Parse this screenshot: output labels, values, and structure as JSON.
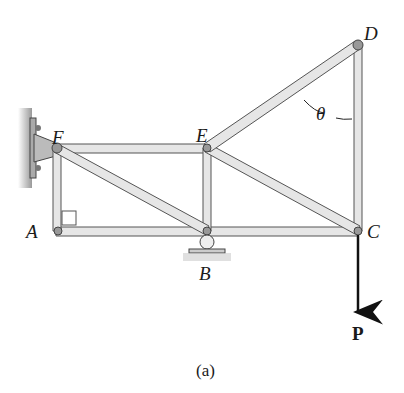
{
  "figure": {
    "caption": "(a)",
    "labels": {
      "A": "A",
      "B": "B",
      "C": "C",
      "D": "D",
      "E": "E",
      "F": "F",
      "theta": "θ",
      "P": "P"
    },
    "colors": {
      "member_fill": "#e6e6e6",
      "member_stroke": "#555555",
      "pin": "#888888",
      "load": "#111111"
    }
  }
}
